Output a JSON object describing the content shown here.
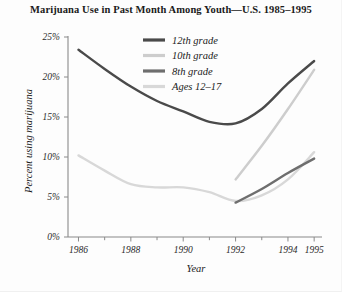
{
  "chart_data": {
    "type": "line",
    "title": "Marijuana Use in Past Month Among Youth—U.S. 1985–1995",
    "xlabel": "Year",
    "ylabel": "Percent using marijuana",
    "xlim": [
      1985.6,
      1995.3
    ],
    "ylim": [
      0,
      25
    ],
    "grid": false,
    "legend_position": "top-center-inside",
    "x_ticks": [
      1986,
      1988,
      1990,
      1992,
      1994,
      1995
    ],
    "x_tick_labels": [
      "1986",
      "1988",
      "1990",
      "1992",
      "1994",
      "1995"
    ],
    "x_minor_ticks": [
      1987,
      1989,
      1991,
      1993
    ],
    "y_ticks": [
      0,
      5,
      10,
      15,
      20,
      25
    ],
    "y_tick_labels": [
      "0%",
      "5%",
      "10%",
      "15%",
      "20%",
      "25%"
    ],
    "series": [
      {
        "name": "12th grade",
        "color": "#4a4a4a",
        "width": 2.4,
        "x": [
          1986,
          1987,
          1988,
          1989,
          1990,
          1991,
          1992,
          1993,
          1994,
          1995
        ],
        "values": [
          23.4,
          21.0,
          18.8,
          17.0,
          15.7,
          14.4,
          14.2,
          16.0,
          19.2,
          22.0
        ]
      },
      {
        "name": "10th grade",
        "color": "#cdcdcd",
        "width": 2.4,
        "x": [
          1992,
          1993,
          1994,
          1995
        ],
        "values": [
          7.2,
          11.4,
          16.0,
          20.9
        ]
      },
      {
        "name": "8th grade",
        "color": "#6e6e6e",
        "width": 2.4,
        "x": [
          1992,
          1993,
          1994,
          1995
        ],
        "values": [
          4.3,
          6.0,
          8.0,
          9.8
        ]
      },
      {
        "name": "Ages 12–17",
        "color": "#d8d8d8",
        "width": 2.4,
        "x": [
          1986,
          1987,
          1988,
          1989,
          1990,
          1991,
          1992,
          1993,
          1994,
          1995
        ],
        "values": [
          10.2,
          8.3,
          6.6,
          6.2,
          6.2,
          5.6,
          4.5,
          5.2,
          7.2,
          10.6
        ]
      }
    ],
    "legend": [
      {
        "label": "12th grade",
        "color": "#4a4a4a"
      },
      {
        "label": "10th grade",
        "color": "#cdcdcd"
      },
      {
        "label": "8th grade",
        "color": "#6e6e6e"
      },
      {
        "label": "Ages 12–17",
        "color": "#d8d8d8"
      }
    ]
  },
  "colors": {
    "background": "#fdfdfd",
    "axis": "#8a8a8a",
    "text": "#1a1a1a"
  }
}
